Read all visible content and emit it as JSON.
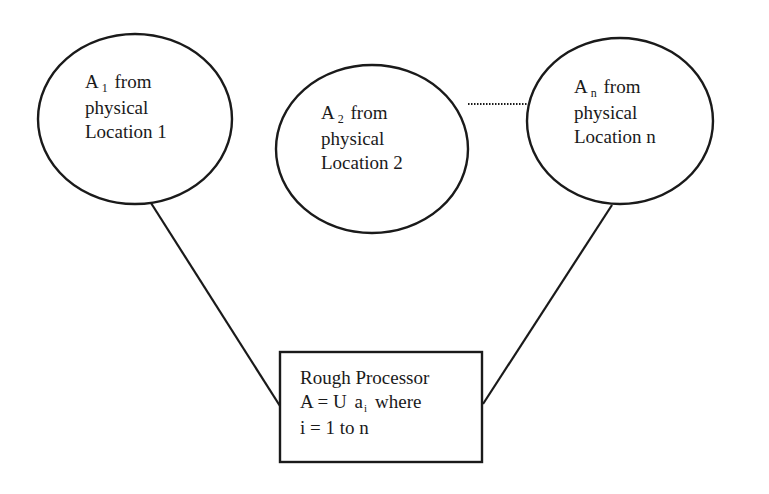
{
  "nodes": [
    {
      "id": "location-1",
      "shape": "ellipse",
      "symbol": "A",
      "subscript": "1",
      "line1_rest": " from",
      "line2": "physical",
      "line3": "Location 1"
    },
    {
      "id": "location-2",
      "shape": "ellipse",
      "symbol": "A",
      "subscript": "2",
      "line1_rest": " from",
      "line2": "physical",
      "line3": "Location 2"
    },
    {
      "id": "location-n",
      "shape": "ellipse",
      "symbol": "A",
      "subscript": "n",
      "line1_rest": " from",
      "line2": "physical",
      "line3": "Location n"
    }
  ],
  "processor": {
    "shape": "rectangle",
    "line1": "Rough Processor",
    "line2_prefix": "A = U",
    "line2_symbol": "a",
    "line2_subscript": "i",
    "line2_suffix": "where",
    "line3": "i = 1 to n"
  },
  "edges": [
    {
      "from": "location-1",
      "to": "processor",
      "style": "solid"
    },
    {
      "from": "location-n",
      "to": "processor",
      "style": "solid"
    },
    {
      "from": "location-2",
      "to": "location-n",
      "style": "dotted"
    }
  ],
  "colors": {
    "stroke": "#1a1a1a",
    "background": "#ffffff"
  }
}
